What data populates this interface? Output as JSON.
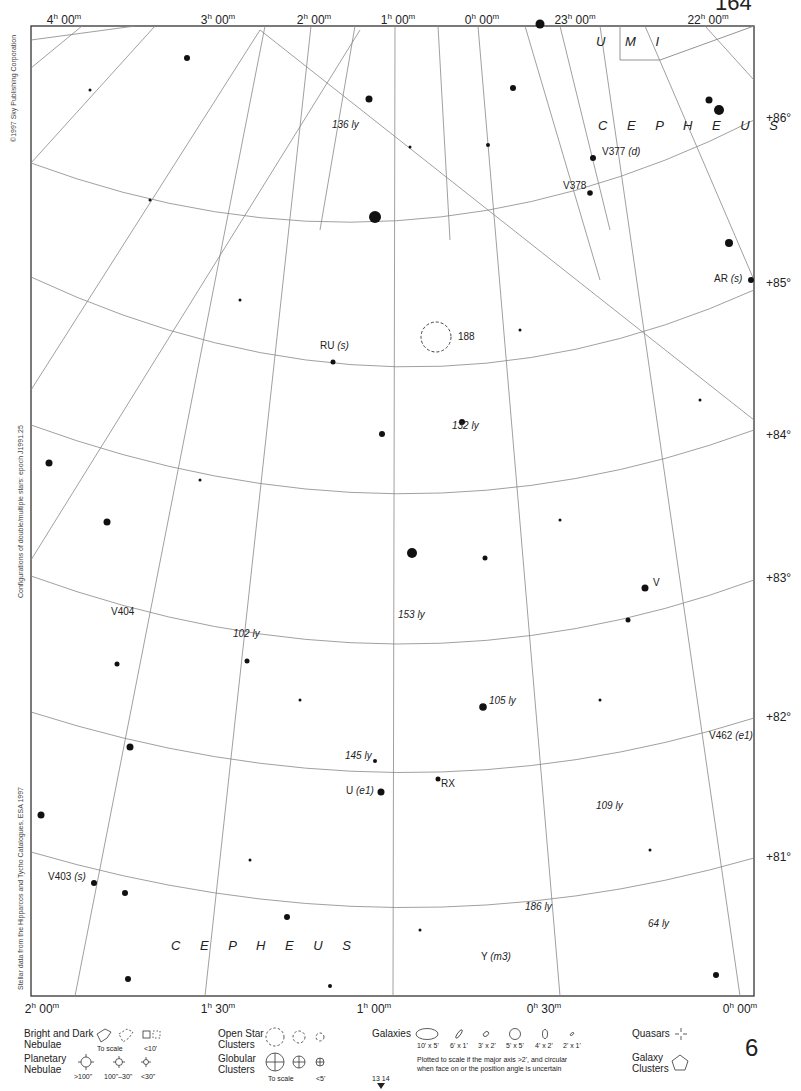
{
  "page": {
    "page_number": "6",
    "top_page_number_partial": "164",
    "adjacent_charts": [
      "13",
      "14"
    ]
  },
  "side_credits": {
    "copyright": "©1997 Sky Publishing Corporation",
    "configurations": "Configurations of double/multiple stars: epoch J1991.25",
    "stellar_data": "Stellar data from the Hipparcos and Tycho Catalogues, ESA 1997"
  },
  "ra_labels_top": [
    {
      "h": "4",
      "m": "00",
      "x": 64
    },
    {
      "h": "3",
      "m": "00",
      "x": 218
    },
    {
      "h": "2",
      "m": "00",
      "x": 314
    },
    {
      "h": "1",
      "m": "00",
      "x": 398
    },
    {
      "h": "0",
      "m": "00",
      "x": 482
    },
    {
      "h": "23",
      "m": "00",
      "x": 575
    },
    {
      "h": "22",
      "m": "00",
      "x": 708
    }
  ],
  "ra_labels_bottom": [
    {
      "h": "2",
      "m": "00",
      "x": 42
    },
    {
      "h": "1",
      "m": "30",
      "x": 218
    },
    {
      "h": "1",
      "m": "00",
      "x": 374
    },
    {
      "h": "0",
      "m": "30",
      "x": 544
    },
    {
      "h": "0",
      "m": "00",
      "x": 740
    }
  ],
  "dec_labels": [
    {
      "text": "+86°",
      "y": 118
    },
    {
      "text": "+85°",
      "y": 283
    },
    {
      "text": "+84°",
      "y": 435
    },
    {
      "text": "+83°",
      "y": 578
    },
    {
      "text": "+82°",
      "y": 717
    },
    {
      "text": "+81°",
      "y": 857
    }
  ],
  "constellations": [
    {
      "name": "U M I",
      "x": 596,
      "y": 42
    },
    {
      "name": "C E P H E U S",
      "x": 598,
      "y": 126
    },
    {
      "name": "C E P H E U S",
      "x": 171,
      "y": 946
    }
  ],
  "star_labels": [
    {
      "name": "V377",
      "suffix": "(d)",
      "x": 602,
      "y": 152
    },
    {
      "name": "V378",
      "suffix": "",
      "x": 563,
      "y": 186
    },
    {
      "name": "AR",
      "suffix": "(s)",
      "x": 714,
      "y": 279
    },
    {
      "name": "RU",
      "suffix": "(s)",
      "x": 320,
      "y": 346
    },
    {
      "name": "V",
      "suffix": "",
      "x": 653,
      "y": 583
    },
    {
      "name": "V404",
      "suffix": "",
      "x": 111,
      "y": 612
    },
    {
      "name": "V462",
      "suffix": "(e1)",
      "x": 709,
      "y": 736
    },
    {
      "name": "U",
      "suffix": "(e1)",
      "x": 346,
      "y": 791
    },
    {
      "name": "RX",
      "suffix": "",
      "x": 441,
      "y": 784
    },
    {
      "name": "V403",
      "suffix": "(s)",
      "x": 48,
      "y": 877
    },
    {
      "name": "Y",
      "suffix": "(m3)",
      "x": 481,
      "y": 957
    }
  ],
  "distance_labels": [
    {
      "text": "136 ly",
      "x": 332,
      "y": 125
    },
    {
      "text": "132 ly",
      "x": 452,
      "y": 426
    },
    {
      "text": "153 ly",
      "x": 398,
      "y": 615
    },
    {
      "text": "102 ly",
      "x": 233,
      "y": 634
    },
    {
      "text": "105 ly",
      "x": 489,
      "y": 701
    },
    {
      "text": "145 ly",
      "x": 345,
      "y": 756
    },
    {
      "text": "109 ly",
      "x": 596,
      "y": 806
    },
    {
      "text": "186 ly",
      "x": 525,
      "y": 907
    },
    {
      "text": "64 ly",
      "x": 648,
      "y": 924
    }
  ],
  "deep_sky_labels": [
    {
      "text": "188",
      "x": 458,
      "y": 337
    }
  ],
  "legend": {
    "nebulae": {
      "label_line1": "Bright and Dark",
      "label_line2": "Nebulae",
      "to_scale": "To scale",
      "small": "<10'"
    },
    "planetary": {
      "label_line1": "Planetary",
      "label_line2": "Nebulae",
      "sizes": [
        ">100\"",
        "100\"–30\"",
        "<30\""
      ]
    },
    "open_clusters": {
      "label_line1": "Open Star",
      "label_line2": "Clusters"
    },
    "globular": {
      "label_line1": "Globular",
      "label_line2": "Clusters",
      "to_scale": "To scale",
      "small": "<5'"
    },
    "galaxies": {
      "label": "Galaxies",
      "sizes": [
        "10' x 5'",
        "6' x 1'",
        "3' x 2'",
        "5' x 5'",
        "4' x 2'",
        "2' x 1'"
      ],
      "note_line1": "Plotted to scale if the major axis >2', and circular",
      "note_line2": "when face on or the position angle is uncertain"
    },
    "quasars": {
      "label": "Quasars"
    },
    "galaxy_clusters": {
      "label_line1": "Galaxy",
      "label_line2": "Clusters"
    }
  },
  "colors": {
    "ink": "#222222",
    "grid": "#888888",
    "frame": "#333333",
    "background": "#ffffff"
  }
}
